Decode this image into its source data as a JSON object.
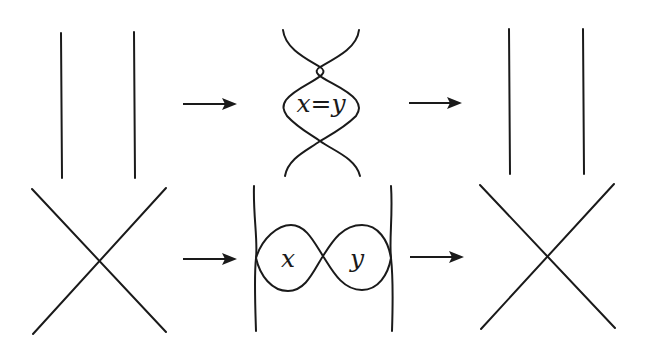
{
  "diagram": {
    "rows": [
      {
        "name": "row-1",
        "panels": [
          {
            "name": "two-parallel-strands",
            "type": "parallel"
          },
          {
            "name": "double-twist-with-region",
            "type": "twist",
            "label": "x=y"
          },
          {
            "name": "two-parallel-strands-result",
            "type": "parallel"
          }
        ]
      },
      {
        "name": "row-2",
        "panels": [
          {
            "name": "single-crossing",
            "type": "crossing"
          },
          {
            "name": "figure-eight-between-strands",
            "type": "figure-eight",
            "labels": [
              "x",
              "y"
            ]
          },
          {
            "name": "single-crossing-result",
            "type": "crossing"
          }
        ]
      }
    ],
    "arrows": [
      "right-arrow",
      "right-arrow",
      "right-arrow",
      "right-arrow"
    ],
    "labels": {
      "top_middle": "x=y",
      "bottom_left_loop": "x",
      "bottom_right_loop": "y"
    },
    "colors": {
      "stroke": "#1a1a1a",
      "background": "#ffffff"
    }
  }
}
